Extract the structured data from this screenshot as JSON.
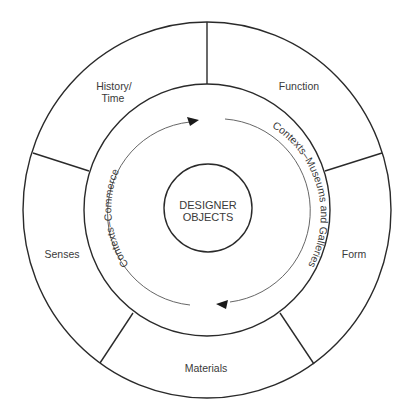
{
  "diagram": {
    "center": {
      "line1": "DESIGNER",
      "line2": "OBJECTS"
    },
    "outer_segments": [
      {
        "id": "history-time",
        "line1": "History/",
        "line2": "Time"
      },
      {
        "id": "function",
        "label": "Function"
      },
      {
        "id": "form",
        "label": "Form"
      },
      {
        "id": "materials",
        "label": "Materials"
      },
      {
        "id": "senses",
        "label": "Senses"
      }
    ],
    "context_arcs": {
      "left": "Contexts–Commerce",
      "right": "Contexts–Museums and Galleries"
    },
    "arrows": {
      "direction": "clockwise",
      "count": 2
    },
    "colors": {
      "line": "#2a2a2a",
      "text": "#3a3a3a",
      "background": "#ffffff"
    }
  }
}
